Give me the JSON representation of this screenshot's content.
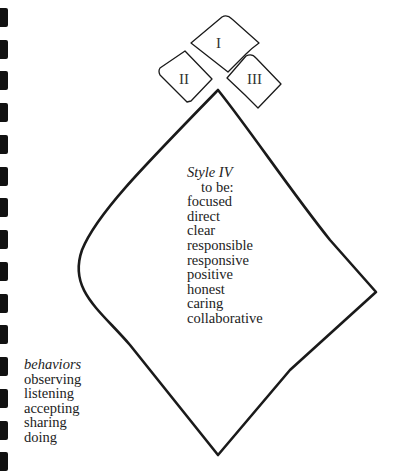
{
  "diagram": {
    "shapes": {
      "style_1": {
        "label": "I"
      },
      "style_2": {
        "label": "II"
      },
      "style_3": {
        "label": "III"
      },
      "style_4": {
        "title": "Style IV",
        "subtitle": "to be:",
        "qualities": [
          "focused",
          "direct",
          "clear",
          "responsible",
          "responsive",
          "positive",
          "honest",
          "caring",
          "collaborative"
        ]
      }
    },
    "behaviors": {
      "title": "behaviors",
      "items": [
        "observing",
        "listening",
        "accepting",
        "sharing",
        "doing"
      ]
    },
    "binding_holes_count": 15
  }
}
